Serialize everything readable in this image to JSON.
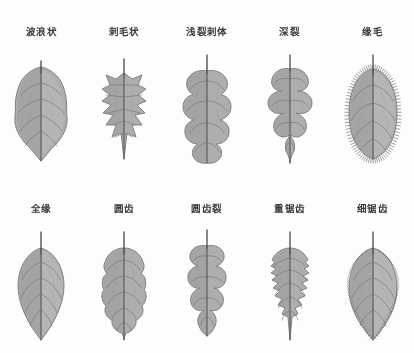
{
  "plate": {
    "title": "",
    "background_color": "#fdfdfd",
    "blade_fill": "#a8a8a8",
    "outline_color": "#6d6d6d",
    "vein_color": "#747474",
    "label_color": "#2b2b2b",
    "rows": 2,
    "columns": 5
  },
  "specimens": [
    {
      "index": 1,
      "row": 1,
      "column": 1,
      "label": "波浪状",
      "margin_type": "undulate",
      "icon": "leaf-undulate-icon"
    },
    {
      "index": 2,
      "row": 1,
      "column": 2,
      "label": "刺毛状",
      "margin_type": "spinose",
      "icon": "leaf-spinose-icon"
    },
    {
      "index": 3,
      "row": 1,
      "column": 3,
      "label": "浅裂刺体",
      "margin_type": "shallow-lobed",
      "icon": "leaf-shallow-lobed-icon"
    },
    {
      "index": 4,
      "row": 1,
      "column": 4,
      "label": "深裂",
      "margin_type": "deeply-lobed",
      "icon": "leaf-deep-lobed-icon"
    },
    {
      "index": 5,
      "row": 1,
      "column": 5,
      "label": "缘毛",
      "margin_type": "ciliate",
      "icon": "leaf-ciliate-icon"
    },
    {
      "index": 6,
      "row": 2,
      "column": 1,
      "label": "全缘",
      "margin_type": "entire",
      "icon": "leaf-entire-icon"
    },
    {
      "index": 7,
      "row": 2,
      "column": 2,
      "label": "圆齿",
      "margin_type": "crenate",
      "icon": "leaf-crenate-icon"
    },
    {
      "index": 8,
      "row": 2,
      "column": 3,
      "label": "圆齿裂",
      "margin_type": "crenate-lobed",
      "icon": "leaf-crenate-lobed-icon"
    },
    {
      "index": 9,
      "row": 2,
      "column": 4,
      "label": "重锯齿",
      "margin_type": "doubly-serrate",
      "icon": "leaf-doubly-serrate-icon"
    },
    {
      "index": 10,
      "row": 2,
      "column": 5,
      "label": "细锯齿",
      "margin_type": "finely-serrate",
      "icon": "leaf-finely-serrate-icon"
    }
  ]
}
